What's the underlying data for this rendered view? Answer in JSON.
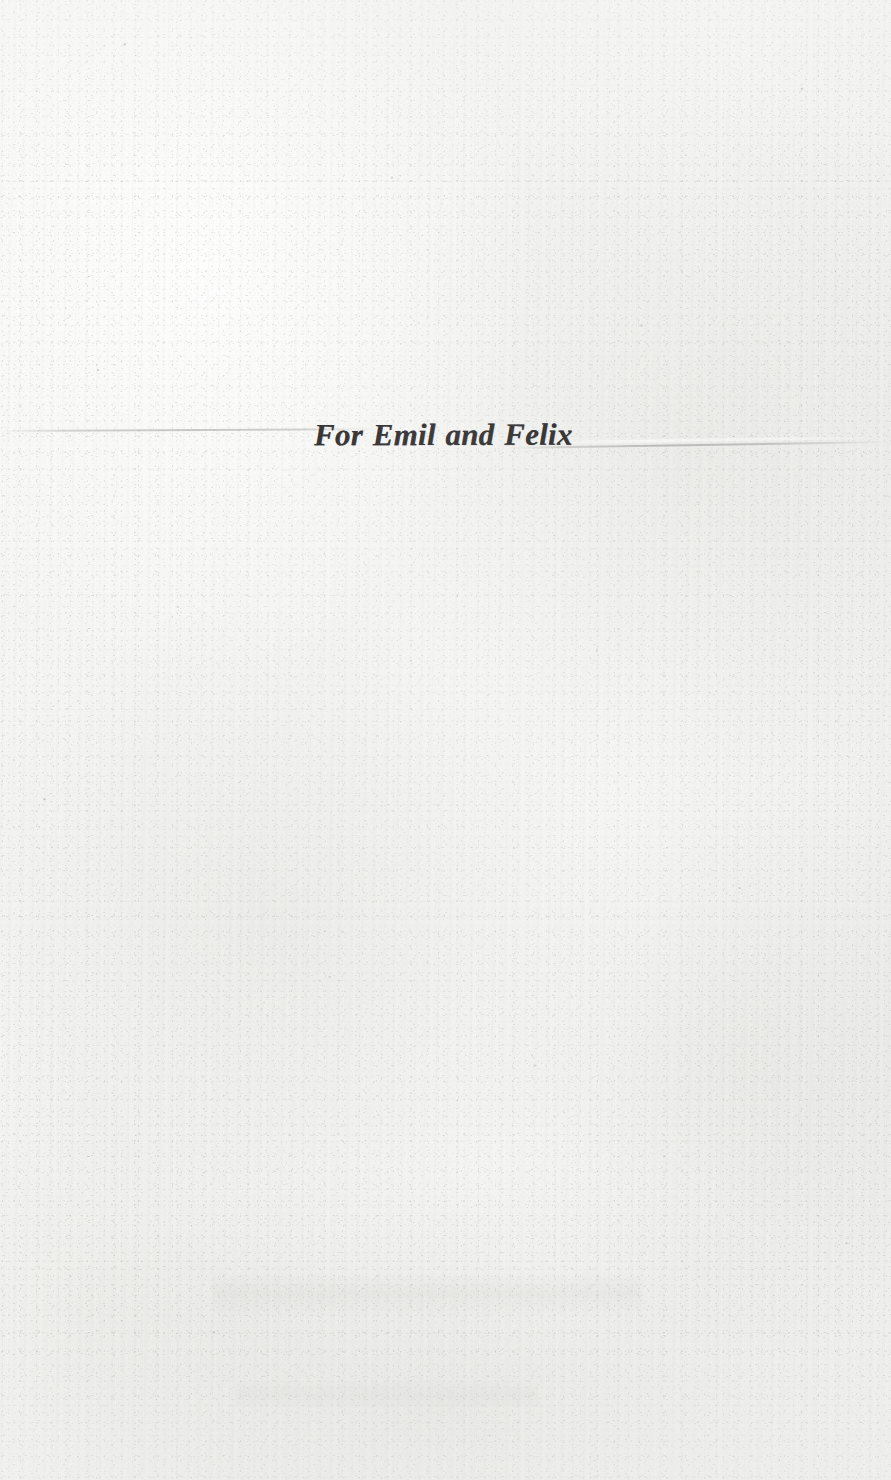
{
  "page": {
    "kind": "book-dedication-page",
    "paper_color": "#f3f3f1",
    "ink_color": "#17171a",
    "width": 891,
    "height": 1480
  },
  "dedication": {
    "text": "For Emil and Felix"
  },
  "artifacts": {
    "crease_label": "paper-crease-line",
    "grain_label": "paper-grain-texture",
    "speck_label": "paper-foxing-specks",
    "showthrough_label": "reverse-side-show-through"
  }
}
